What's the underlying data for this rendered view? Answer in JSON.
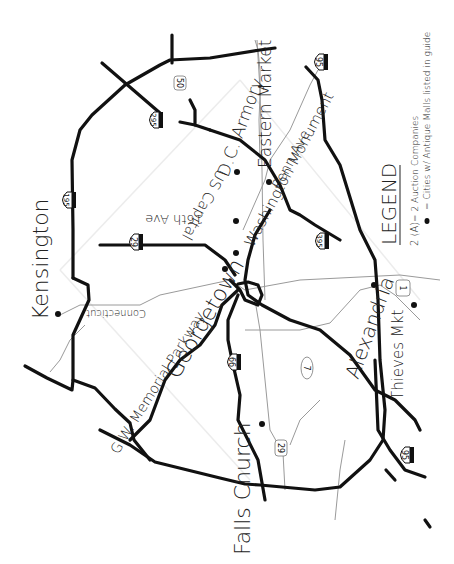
{
  "map": {
    "title": "Washington DC Area Antique Guide Map",
    "cities": [
      {
        "name": "Kensington"
      },
      {
        "name": "Georgetown"
      },
      {
        "name": "Falls Church"
      },
      {
        "name": "Alexandria"
      },
      {
        "name": "Thieves Mkt"
      },
      {
        "name": "D.C. Armory"
      },
      {
        "name": "Eastern Market"
      },
      {
        "name": "Penn Ave"
      },
      {
        "name": "Washington Monument"
      },
      {
        "name": "US Capital"
      },
      {
        "name": "16th Ave"
      },
      {
        "name": "G.W. Memorial Parkway"
      },
      {
        "name": "Connecticut"
      }
    ],
    "shields": [
      {
        "type": "interstate",
        "number": "95",
        "position": "top"
      },
      {
        "type": "interstate",
        "number": "295"
      },
      {
        "type": "us-route",
        "number": "50"
      },
      {
        "type": "interstate",
        "number": "195"
      },
      {
        "type": "interstate",
        "number": "29"
      },
      {
        "type": "interstate",
        "number": "395"
      },
      {
        "type": "interstate",
        "number": "66"
      },
      {
        "type": "state-route",
        "number": "7"
      },
      {
        "type": "us-route",
        "number": "29"
      },
      {
        "type": "us-route",
        "number": "1"
      },
      {
        "type": "interstate",
        "number": "95",
        "position": "bottom"
      }
    ],
    "legend": {
      "title": "LEGEND",
      "items": [
        {
          "symbol": "2 (A)",
          "text": "= 2 Auction Companies"
        },
        {
          "symbol": "dot",
          "text": "= Cities w/ Antique Malls listed in guide"
        }
      ]
    },
    "colors": {
      "road": "#111111",
      "minor_road": "#9a9a9a",
      "background": "#ffffff"
    }
  }
}
